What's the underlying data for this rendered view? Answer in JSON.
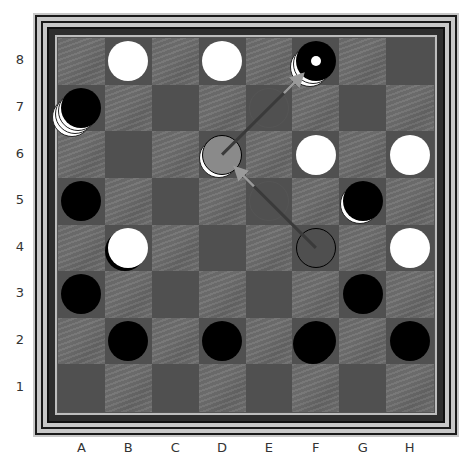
{
  "board": {
    "columns": [
      "A",
      "B",
      "C",
      "D",
      "E",
      "F",
      "G",
      "H"
    ],
    "rows": [
      "8",
      "7",
      "6",
      "5",
      "4",
      "3",
      "2",
      "1"
    ],
    "colors": {
      "textured_square": "#6e6e6e",
      "plain_square": "#505050",
      "frame_light": "#c8c8c8",
      "frame_dark": "#1a1a1a",
      "arrow": "#9a9a9a"
    }
  },
  "pieces": [
    {
      "square": "B8",
      "color": "white",
      "stack": 1
    },
    {
      "square": "D8",
      "color": "white",
      "stack": 1
    },
    {
      "square": "F8",
      "color": "black",
      "stack": 3,
      "under": "white",
      "marker": "white-dot"
    },
    {
      "square": "A7",
      "color": "black",
      "stack": 4,
      "under": "white"
    },
    {
      "square": "D6",
      "color": "gray",
      "stack": 2,
      "under": "white"
    },
    {
      "square": "F6",
      "color": "white",
      "stack": 1
    },
    {
      "square": "H6",
      "color": "white",
      "stack": 1
    },
    {
      "square": "A5",
      "color": "black",
      "stack": 1
    },
    {
      "square": "G5",
      "color": "black",
      "stack": 2,
      "under": "white"
    },
    {
      "square": "B4",
      "color": "white",
      "stack": 2,
      "under": "black"
    },
    {
      "square": "F4",
      "color": "outline",
      "stack": 1
    },
    {
      "square": "H4",
      "color": "white",
      "stack": 1
    },
    {
      "square": "A3",
      "color": "black",
      "stack": 1
    },
    {
      "square": "G3",
      "color": "black",
      "stack": 1
    },
    {
      "square": "B2",
      "color": "black",
      "stack": 1
    },
    {
      "square": "D2",
      "color": "black",
      "stack": 1
    },
    {
      "square": "F2",
      "color": "black",
      "stack": 2
    },
    {
      "square": "H2",
      "color": "black",
      "stack": 1
    }
  ],
  "ghosts": [
    "E7",
    "E5"
  ],
  "moves": [
    {
      "from": "F4",
      "to": "D6"
    },
    {
      "from": "D6",
      "to": "F8"
    }
  ]
}
